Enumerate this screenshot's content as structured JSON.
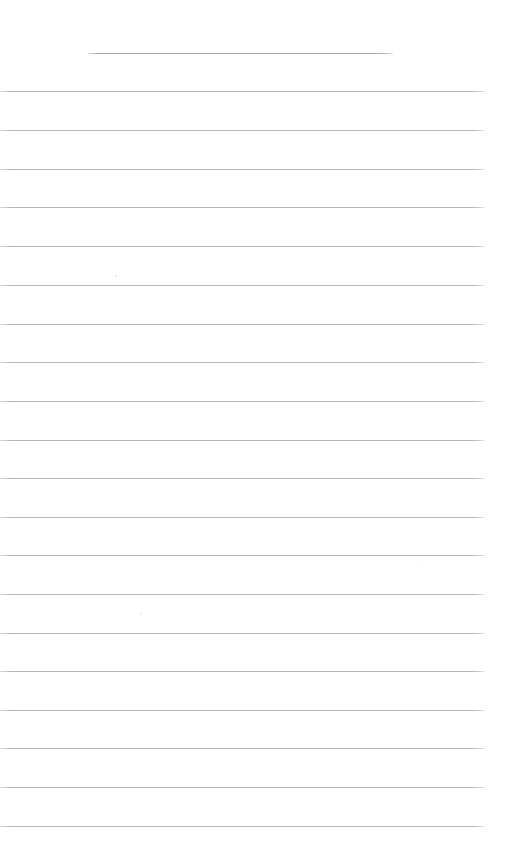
{
  "document": {
    "kind": "scanned-blank-ruled-paper",
    "title": "Blank Ruled Paper Scan",
    "page_width": 507,
    "page_height": 859,
    "background_color": "#ffffff",
    "rule_color": "#b6b6bb",
    "title_rule_color": "#a9a9af",
    "written_text": "",
    "rule_count_total": 21,
    "rule_count_full_width": 20,
    "rule_count_short": 1,
    "rule_spacing_px": 38.7,
    "content_note": "No handwriting, no printed text, no headers — page is empty"
  },
  "rules": [
    {
      "name": "title-rule",
      "x": 88,
      "y": 53,
      "width": 305,
      "full_width": false
    },
    {
      "name": "rule-01",
      "x": 0,
      "y": 91,
      "width": 485,
      "full_width": true
    },
    {
      "name": "rule-02",
      "x": 0,
      "y": 130,
      "width": 485,
      "full_width": true
    },
    {
      "name": "rule-03",
      "x": 0,
      "y": 169,
      "width": 485,
      "full_width": true
    },
    {
      "name": "rule-04",
      "x": 0,
      "y": 207,
      "width": 485,
      "full_width": true
    },
    {
      "name": "rule-05",
      "x": 0,
      "y": 246,
      "width": 485,
      "full_width": true
    },
    {
      "name": "rule-06",
      "x": 0,
      "y": 285,
      "width": 485,
      "full_width": true
    },
    {
      "name": "rule-07",
      "x": 0,
      "y": 324,
      "width": 485,
      "full_width": true
    },
    {
      "name": "rule-08",
      "x": 0,
      "y": 362,
      "width": 485,
      "full_width": true
    },
    {
      "name": "rule-09",
      "x": 0,
      "y": 401,
      "width": 485,
      "full_width": true
    },
    {
      "name": "rule-10",
      "x": 0,
      "y": 440,
      "width": 485,
      "full_width": true
    },
    {
      "name": "rule-11",
      "x": 0,
      "y": 478,
      "width": 485,
      "full_width": true
    },
    {
      "name": "rule-12",
      "x": 0,
      "y": 517,
      "width": 485,
      "full_width": true
    },
    {
      "name": "rule-13",
      "x": 0,
      "y": 555,
      "width": 485,
      "full_width": true
    },
    {
      "name": "rule-14",
      "x": 0,
      "y": 594,
      "width": 485,
      "full_width": true
    },
    {
      "name": "rule-15",
      "x": 0,
      "y": 633,
      "width": 485,
      "full_width": true
    },
    {
      "name": "rule-16",
      "x": 0,
      "y": 671,
      "width": 485,
      "full_width": true
    },
    {
      "name": "rule-17",
      "x": 0,
      "y": 710,
      "width": 485,
      "full_width": true
    },
    {
      "name": "rule-18",
      "x": 0,
      "y": 748,
      "width": 485,
      "full_width": true
    },
    {
      "name": "rule-19",
      "x": 0,
      "y": 787,
      "width": 485,
      "full_width": true
    },
    {
      "name": "rule-20",
      "x": 0,
      "y": 826,
      "width": 485,
      "full_width": true
    }
  ],
  "specks": [
    {
      "x": 115,
      "y": 275,
      "size": 2
    },
    {
      "x": 140,
      "y": 613,
      "size": 2
    },
    {
      "x": 62,
      "y": 492,
      "size": 1
    },
    {
      "x": 330,
      "y": 198,
      "size": 1
    },
    {
      "x": 418,
      "y": 560,
      "size": 1
    }
  ]
}
